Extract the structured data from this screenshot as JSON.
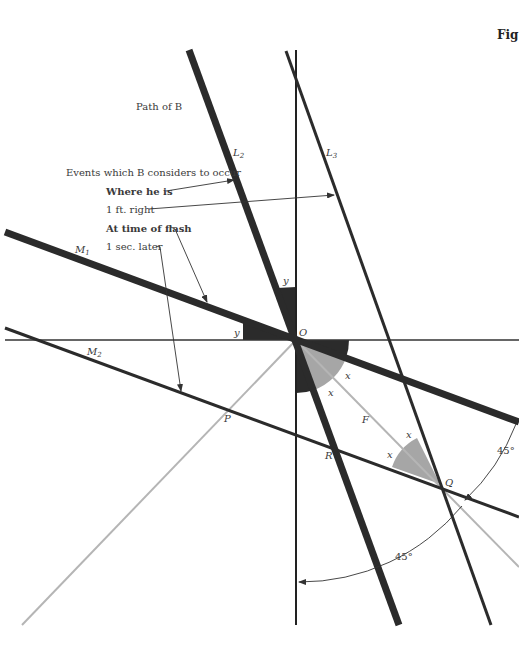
{
  "figure": {
    "label": "Fig",
    "colors": {
      "thick_line": "#2b2b2b",
      "thin_line": "#333333",
      "gray_line": "#b5b5b5",
      "dark_angle": "#2b2b2b",
      "gray_angle": "#a6a6a6"
    },
    "annotations": {
      "path_of_b": "Path of B",
      "events_heading": "Events which B considers to occur",
      "where_he_is": "Where he is",
      "one_ft_right": "1 ft. right",
      "at_time_of_flash": "At time of flash",
      "one_sec_later": "1 sec. later"
    },
    "lines": {
      "L2": "L",
      "L2_sub": "2",
      "L3": "L",
      "L3_sub": "3",
      "M1": "M",
      "M1_sub": "1",
      "M2": "M",
      "M2_sub": "2",
      "F": "F"
    },
    "points": {
      "O": "O",
      "P": "P",
      "R": "R",
      "Q": "Q"
    },
    "angles": {
      "y_top": "y",
      "y_left": "y",
      "x_o_right": "x",
      "x_o_lower": "x",
      "x_q_upper": "x",
      "x_q_left": "x",
      "deg_right": "45°",
      "deg_bottom": "45°"
    }
  }
}
